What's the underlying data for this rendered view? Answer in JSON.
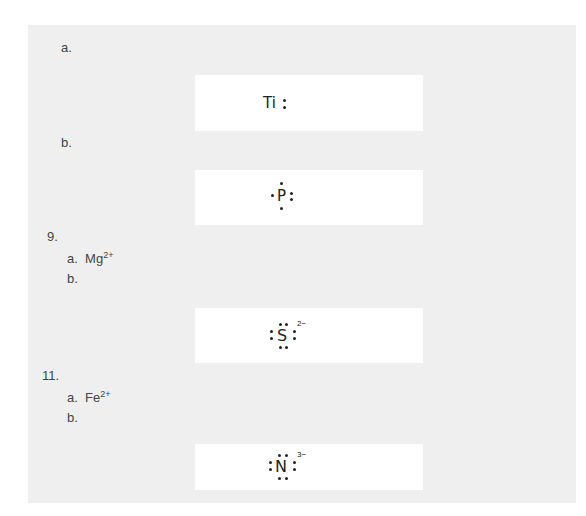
{
  "items": [
    {
      "label": "a.",
      "structure": {
        "symbol": "Ti",
        "suffix": ":"
      }
    },
    {
      "label": "b.",
      "structure": {
        "symbol": "P"
      }
    },
    {
      "number": "9.",
      "a": {
        "prefix": "a.",
        "ion": "Mg",
        "charge": "2+"
      },
      "b": {
        "label": "b."
      },
      "structure": {
        "symbol": "S",
        "charge": "2−"
      }
    },
    {
      "number": "11.",
      "a": {
        "prefix": "a.",
        "ion": "Fe",
        "charge": "2+"
      },
      "b": {
        "label": "b."
      },
      "structure": {
        "symbol": "N",
        "charge": "3−"
      }
    }
  ],
  "colors": {
    "panel": "#efefef",
    "box": "#ffffff",
    "text": "#444444"
  }
}
